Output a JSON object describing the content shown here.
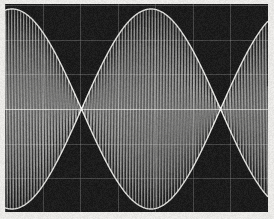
{
  "instrument": {
    "display_type": "oscilloscope-crt",
    "screen_label": "",
    "bezel_color": "#f0efec",
    "screen_color": "#0b0b0b",
    "trace_color": "#f2f2f0",
    "graticule_color": "#8a8a8a"
  },
  "screen_geometry": {
    "x": 5,
    "y": 4,
    "width": 263,
    "height": 208
  },
  "graticule": {
    "visible": true,
    "horizontal_divisions": 6,
    "vertical_divisions": 7,
    "center_line_y": 109,
    "line_opacity": 0.34
  },
  "chart_data": {
    "type": "line",
    "title": "",
    "subtitle": "",
    "xlabel": "",
    "ylabel": "",
    "annotations": [],
    "legend": [],
    "grid": true,
    "legend_position": "none",
    "waveform": "amplitude-modulated-sine",
    "modulation_index": 1.0,
    "carrier_cycles_visible": 88,
    "modulation_cycles_visible": 1.85,
    "baseline_y_px": 109,
    "peak_amplitude_px": 100,
    "node_positions_px": [
      12,
      150
    ],
    "antinode_positions_px": [
      80,
      222
    ],
    "envelope_period_px": 139,
    "x": [
      0,
      12,
      25,
      40,
      55,
      70,
      80,
      92,
      108,
      124,
      138,
      150,
      162,
      178,
      194,
      208,
      222,
      236,
      250,
      263
    ],
    "envelope_upper": [
      42,
      2,
      28,
      62,
      86,
      98,
      100,
      97,
      84,
      60,
      28,
      2,
      30,
      62,
      86,
      97,
      100,
      96,
      82,
      62
    ],
    "envelope_lower": [
      -42,
      -2,
      -28,
      -62,
      -86,
      -98,
      -100,
      -97,
      -84,
      -60,
      -28,
      -2,
      -30,
      -62,
      -86,
      -97,
      -100,
      -96,
      -82,
      -62
    ]
  }
}
